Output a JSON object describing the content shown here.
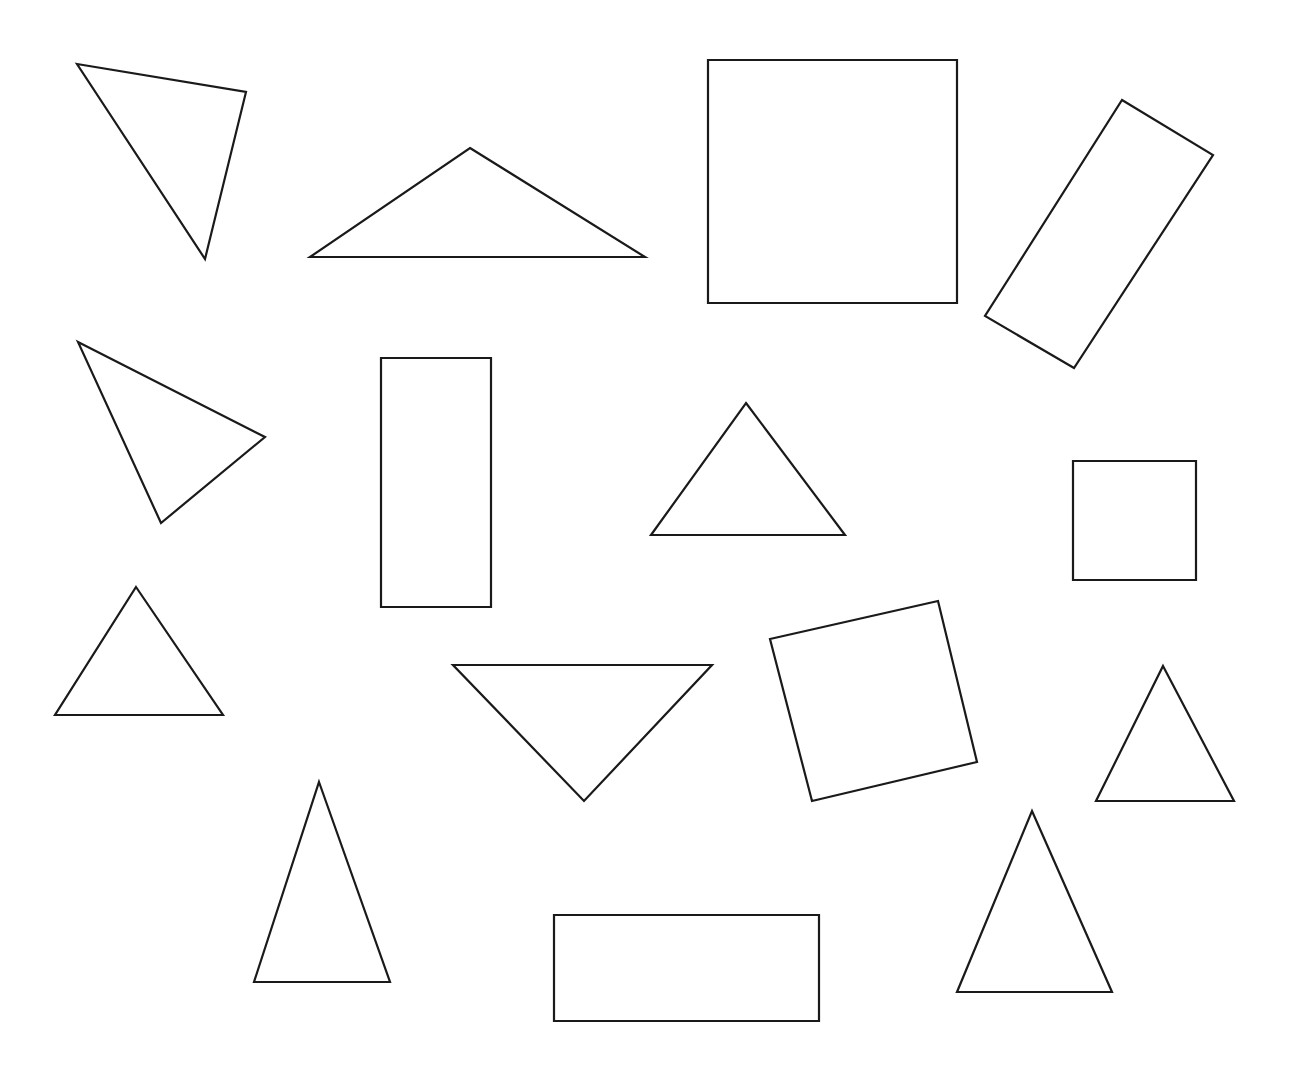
{
  "page": {
    "width": 1297,
    "height": 1076,
    "background_color": "#ffffff",
    "stroke_color": "#1a1a1a",
    "fill_color": "#ffffff",
    "stroke_width": 2.2,
    "shape_count": 15,
    "shape_type_counts": {
      "triangle": 9,
      "square": 3,
      "rectangle": 3
    }
  },
  "shapes": [
    {
      "id": "shape-1",
      "name": "scalene-triangle-top-left",
      "type": "triangle",
      "orientation": "tilted-point-down",
      "points": "77,64 246,92 205,259"
    },
    {
      "id": "shape-2",
      "name": "wide-triangle-top",
      "type": "triangle",
      "orientation": "upright-wide",
      "points": "470,148 645,257 310,257"
    },
    {
      "id": "shape-3",
      "name": "large-square-top",
      "type": "square",
      "orientation": "axis-aligned",
      "points": "708,60 957,60 957,303 708,303"
    },
    {
      "id": "shape-4",
      "name": "rotated-rectangle-top-right",
      "type": "rectangle",
      "orientation": "rotated",
      "points": "1122,100 1213,155 1074,368 985,316"
    },
    {
      "id": "shape-5",
      "name": "scalene-triangle-mid-left",
      "type": "triangle",
      "orientation": "tilted-point-right",
      "points": "78,342 265,437 161,523"
    },
    {
      "id": "shape-6",
      "name": "tall-rectangle-mid",
      "type": "rectangle",
      "orientation": "axis-aligned-portrait",
      "points": "381,358 491,358 491,607 381,607"
    },
    {
      "id": "shape-7",
      "name": "equilateral-triangle-mid",
      "type": "triangle",
      "orientation": "upright",
      "points": "746,403 845,535 651,535"
    },
    {
      "id": "shape-8",
      "name": "small-square-right",
      "type": "square",
      "orientation": "axis-aligned",
      "points": "1073,461 1196,461 1196,580 1073,580"
    },
    {
      "id": "shape-9",
      "name": "equilateral-triangle-left",
      "type": "triangle",
      "orientation": "upright",
      "points": "136,587 223,715 55,715"
    },
    {
      "id": "shape-10",
      "name": "inverted-triangle-mid",
      "type": "triangle",
      "orientation": "point-down",
      "points": "453,665 712,665 584,801"
    },
    {
      "id": "shape-11",
      "name": "rotated-square-mid-right",
      "type": "square",
      "orientation": "rotated",
      "points": "938,601 977,762 812,801 770,639"
    },
    {
      "id": "shape-12",
      "name": "small-triangle-far-right",
      "type": "triangle",
      "orientation": "upright",
      "points": "1163,666 1234,801 1096,801"
    },
    {
      "id": "shape-13",
      "name": "tall-triangle-bottom-left",
      "type": "triangle",
      "orientation": "upright-narrow",
      "points": "319,782 390,982 254,982"
    },
    {
      "id": "shape-14",
      "name": "triangle-bottom-right",
      "type": "triangle",
      "orientation": "upright",
      "points": "1032,811 1112,992 957,992"
    },
    {
      "id": "shape-15",
      "name": "wide-rectangle-bottom",
      "type": "rectangle",
      "orientation": "axis-aligned-landscape",
      "points": "554,915 819,915 819,1021 554,1021"
    }
  ]
}
